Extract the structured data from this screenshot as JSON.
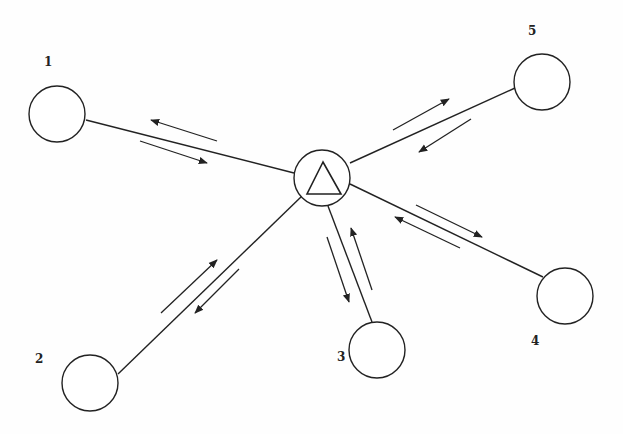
{
  "diagram": {
    "type": "star-network",
    "hub": {
      "shape": "circle-with-triangle",
      "cx": 322,
      "cy": 178,
      "r": 28
    },
    "nodes": [
      {
        "id": "1",
        "label": "1",
        "cx": 57,
        "cy": 114,
        "lx": 44,
        "ly": 66,
        "line": [
          86,
          120,
          294,
          173
        ],
        "arrows": [
          [
            217,
            141,
            151,
            120
          ],
          [
            140,
            141,
            207,
            163
          ]
        ]
      },
      {
        "id": "2",
        "label": "2",
        "cx": 90,
        "cy": 383,
        "lx": 35,
        "ly": 363,
        "line": [
          118,
          374,
          303,
          195
        ],
        "arrows": [
          [
            161,
            313,
            217,
            260
          ],
          [
            239,
            269,
            195,
            313
          ]
        ]
      },
      {
        "id": "3",
        "label": "3",
        "cx": 377,
        "cy": 350,
        "lx": 337,
        "ly": 361,
        "line": [
          372,
          322,
          328,
          206
        ],
        "arrows": [
          [
            327,
            237,
            349,
            302
          ],
          [
            372,
            290,
            351,
            228
          ]
        ]
      },
      {
        "id": "4",
        "label": "4",
        "cx": 565,
        "cy": 296,
        "lx": 531,
        "ly": 345,
        "line": [
          543,
          277,
          350,
          184
        ],
        "arrows": [
          [
            416,
            205,
            482,
            237
          ],
          [
            460,
            248,
            395,
            217
          ]
        ]
      },
      {
        "id": "5",
        "label": "5",
        "cx": 542,
        "cy": 82,
        "lx": 528,
        "ly": 35,
        "line": [
          515,
          88,
          350,
          163
        ],
        "arrows": [
          [
            393,
            130,
            449,
            99
          ],
          [
            471,
            119,
            419,
            152
          ]
        ]
      }
    ],
    "node_radius": 28,
    "stroke_color": "#222222"
  }
}
